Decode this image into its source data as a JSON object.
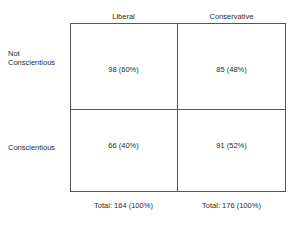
{
  "figure": {
    "type": "contingency-table",
    "background_color": "#ffffff",
    "line_color": "#555555",
    "text_color": "#2b2b2b"
  },
  "chart_data": {
    "type": "table",
    "title": "",
    "xlabel": "",
    "ylabel": "",
    "legend": [],
    "grid": true,
    "column_headers": [
      "Liberal",
      "Conservative"
    ],
    "row_headers": [
      "Not Conscientious",
      "Conscientious"
    ],
    "row_header_lines": [
      [
        "Not",
        "Conscientious"
      ],
      [
        "Conscientious"
      ]
    ],
    "counts": [
      [
        98,
        85
      ],
      [
        66,
        91
      ]
    ],
    "percents": [
      [
        60,
        48
      ],
      [
        40,
        52
      ]
    ],
    "cells": [
      [
        "98 (60%)",
        "85 (48%)"
      ],
      [
        "66 (40%)",
        "91 (52%)"
      ]
    ],
    "column_totals": [
      164,
      176
    ],
    "column_total_percents": [
      100,
      100
    ],
    "column_total_labels": [
      "Total: 164 (100%)",
      "Total: 176 (100%)"
    ]
  }
}
